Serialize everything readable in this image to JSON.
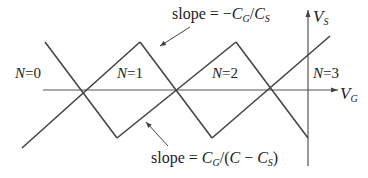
{
  "diagram": {
    "type": "coulomb-diamond",
    "colors": {
      "line": "#444444",
      "text": "#222222",
      "background": "#ffffff"
    },
    "axes": {
      "horizontal": {
        "symbol": "V",
        "subscript": "G"
      },
      "vertical": {
        "symbol": "V",
        "subscript": "S"
      }
    },
    "regions": [
      {
        "label": "N=0",
        "n": "N",
        "eq": "=0"
      },
      {
        "label": "N=1",
        "n": "N",
        "eq": "=1"
      },
      {
        "label": "N=2",
        "n": "N",
        "eq": "=2"
      },
      {
        "label": "N=3",
        "n": "N",
        "eq": "=3"
      }
    ],
    "annotations": {
      "top": {
        "prefix": "slope = ",
        "expr": "−C_G/C_S",
        "parts": [
          "−",
          "C",
          "G",
          "/",
          "C",
          "S"
        ]
      },
      "bottom": {
        "prefix": "slope = ",
        "expr": "C_G/(C − C_S)",
        "parts": [
          "C",
          "G",
          "/(",
          "C",
          " − ",
          "C",
          "S",
          ")"
        ]
      }
    }
  }
}
